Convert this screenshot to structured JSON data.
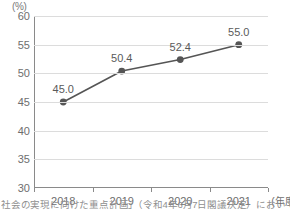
{
  "chart_data": {
    "type": "line",
    "title": "",
    "subtitle": "",
    "xlabel": "(年度)",
    "ylabel": "(%)",
    "categories": [
      "2018",
      "2019",
      "2020",
      "2021"
    ],
    "values": [
      45.0,
      50.4,
      52.4,
      55.0
    ],
    "point_labels": [
      "45.0",
      "50.4",
      "52.4",
      "55.0"
    ],
    "series": [
      {
        "name": "",
        "values": [
          45.0,
          50.4,
          52.4,
          55.0
        ]
      }
    ],
    "ylim": [
      30,
      60
    ],
    "yticks": [
      60,
      55,
      50,
      45,
      40,
      35,
      30
    ],
    "ytick_labels": [
      "60",
      "55",
      "50",
      "45",
      "40",
      "35",
      "30"
    ],
    "grid": true,
    "grid_axis": "y",
    "legend": false,
    "legend_position": "none",
    "marker": "circle",
    "colors": {
      "line": "#555555",
      "marker": "#555555",
      "grid": "#dcdcdc",
      "axis": "#8a8a8a",
      "text": "#6e6e6e",
      "label": "#5a5a5a",
      "background": "#ffffff"
    }
  },
  "axis": {
    "y_unit_label": "(%)",
    "x_unit_label": "(年度)"
  },
  "caption": {
    "text": "社会の実現に向けた重点計画」（令和4年6月7日閣議決定）において、出典）"
  }
}
